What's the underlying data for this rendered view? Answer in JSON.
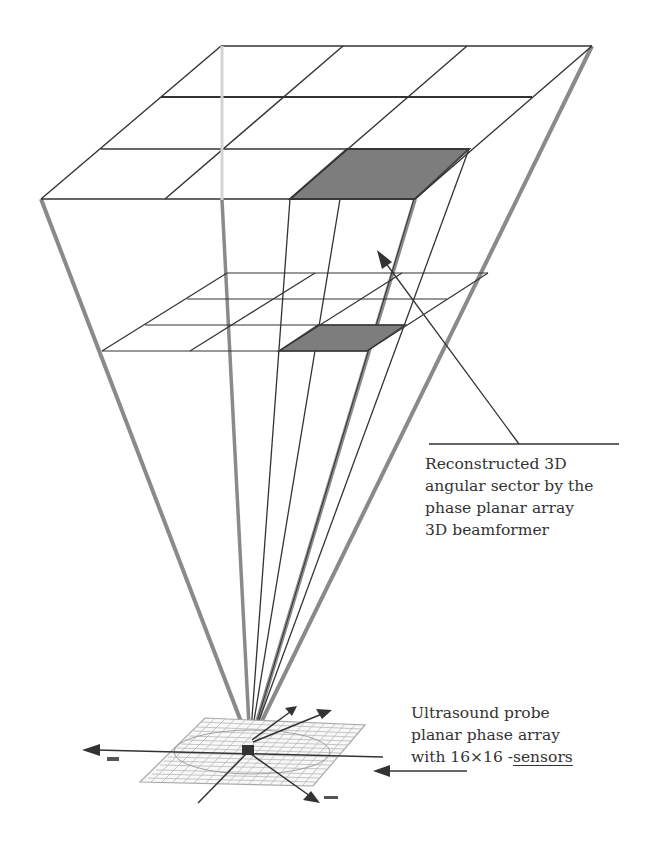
{
  "diagram": {
    "colors": {
      "line": "#333333",
      "beam": "#8a8a8a",
      "light_beam": "#d4d4d4",
      "shade": "#7d7d7d",
      "background": "#ffffff"
    },
    "annotations": {
      "sector": {
        "lines": [
          "Reconstructed 3D",
          "angular sector by the",
          "phase planar array",
          "3D beamformer"
        ]
      },
      "probe": {
        "line1": "Ultrasound probe",
        "line2": "planar phase array",
        "line3_pre": "with 1",
        "line3_mid": "6×16 -",
        "line3_end": "sensors"
      }
    },
    "grids": {
      "far_plane": {
        "rows": 3,
        "cols": 3,
        "shaded_cell": "row 3, col 3"
      },
      "near_plane": {
        "rows": 3,
        "cols": 3,
        "shaded_cell": "row 3, col 3"
      },
      "probe_array": {
        "rows": 16,
        "cols": 16
      }
    }
  }
}
